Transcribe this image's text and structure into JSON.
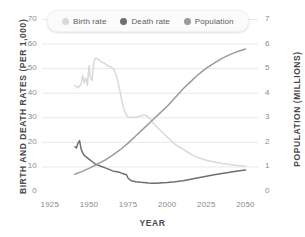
{
  "chart_data": {
    "type": "line",
    "title": "",
    "xlabel": "YEAR",
    "ylabel": "BIRTH AND DEATH RATES (PER 1,000)",
    "y2label": "POPULATION (MILLIONS)",
    "xlim": [
      1920,
      2058
    ],
    "ylim": [
      0,
      70
    ],
    "y2lim": [
      0,
      7
    ],
    "grid": true,
    "legend_position": "top-center",
    "xticks": [
      1925,
      1950,
      1975,
      2000,
      2025,
      2050
    ],
    "yticks": [
      0,
      10,
      20,
      30,
      40,
      50,
      60,
      70
    ],
    "y2ticks": [
      0,
      1,
      2,
      3,
      4,
      5,
      6,
      7
    ],
    "series": [
      {
        "name": "Birth rate",
        "axis": "left",
        "color": "#d9d9d9",
        "x": [
          1941,
          1943,
          1945,
          1946,
          1947,
          1948,
          1949,
          1950,
          1951,
          1952,
          1953,
          1954,
          1955,
          1956,
          1958,
          1960,
          1962,
          1964,
          1965,
          1966,
          1967,
          1968,
          1969,
          1970,
          1971,
          1972,
          1973,
          1974,
          1975,
          1977,
          1980,
          1983,
          1985,
          1987,
          1989,
          1990,
          1992,
          1995,
          2000,
          2005,
          2010,
          2015,
          2020,
          2025,
          2030,
          2035,
          2040,
          2045,
          2050
        ],
        "y": [
          43,
          42,
          43.5,
          47,
          44,
          46,
          43,
          51,
          46,
          45,
          52,
          54,
          54,
          53.5,
          52.5,
          52,
          51,
          50.5,
          50,
          49.5,
          48,
          46,
          43,
          40,
          37,
          34,
          32,
          31,
          30,
          30,
          30,
          30.5,
          31,
          30.5,
          29.5,
          28.5,
          27,
          25,
          22,
          19,
          17,
          15,
          13.5,
          12.5,
          11.8,
          11.2,
          10.8,
          10.4,
          10.1
        ]
      },
      {
        "name": "Death rate",
        "axis": "left",
        "color": "#6f6f6f",
        "x": [
          1941,
          1942,
          1943,
          1944,
          1945,
          1946,
          1947,
          1948,
          1950,
          1952,
          1954,
          1956,
          1958,
          1960,
          1962,
          1964,
          1965,
          1966,
          1968,
          1970,
          1971,
          1972,
          1973,
          1974,
          1975,
          1977,
          1980,
          1983,
          1985,
          1988,
          1990,
          1993,
          1995,
          2000,
          2005,
          2010,
          2015,
          2020,
          2025,
          2030,
          2035,
          2040,
          2045,
          2050
        ],
        "y": [
          18,
          17.5,
          19.5,
          20.5,
          17,
          15.5,
          14.5,
          14,
          13,
          12,
          11,
          10.5,
          10,
          9.5,
          9,
          8.5,
          8.2,
          8,
          7.8,
          7.5,
          7.2,
          7,
          6.8,
          6.6,
          5.2,
          4.2,
          3.8,
          3.6,
          3.5,
          3.3,
          3.2,
          3.2,
          3.3,
          3.5,
          3.8,
          4.2,
          4.8,
          5.4,
          6.0,
          6.6,
          7.1,
          7.6,
          8.1,
          8.5
        ]
      },
      {
        "name": "Population",
        "axis": "right",
        "color": "#9b9b9b",
        "x": [
          1941,
          1945,
          1950,
          1955,
          1960,
          1965,
          1970,
          1975,
          1980,
          1985,
          1990,
          1995,
          2000,
          2005,
          2010,
          2015,
          2020,
          2025,
          2030,
          2035,
          2040,
          2045,
          2050
        ],
        "y": [
          0.68,
          0.78,
          0.92,
          1.08,
          1.25,
          1.45,
          1.68,
          1.95,
          2.25,
          2.55,
          2.85,
          3.15,
          3.45,
          3.8,
          4.15,
          4.45,
          4.75,
          5.0,
          5.2,
          5.4,
          5.55,
          5.68,
          5.78
        ]
      }
    ]
  },
  "legend": {
    "items": [
      {
        "label": "Birth rate",
        "color": "#d9d9d9"
      },
      {
        "label": "Death rate",
        "color": "#6f6f6f"
      },
      {
        "label": "Population",
        "color": "#9b9b9b"
      }
    ]
  },
  "axes": {
    "y_left_title": "BIRTH AND DEATH RATES (PER 1,000)",
    "y_right_title": "POPULATION (MILLIONS)",
    "x_title": "YEAR"
  }
}
